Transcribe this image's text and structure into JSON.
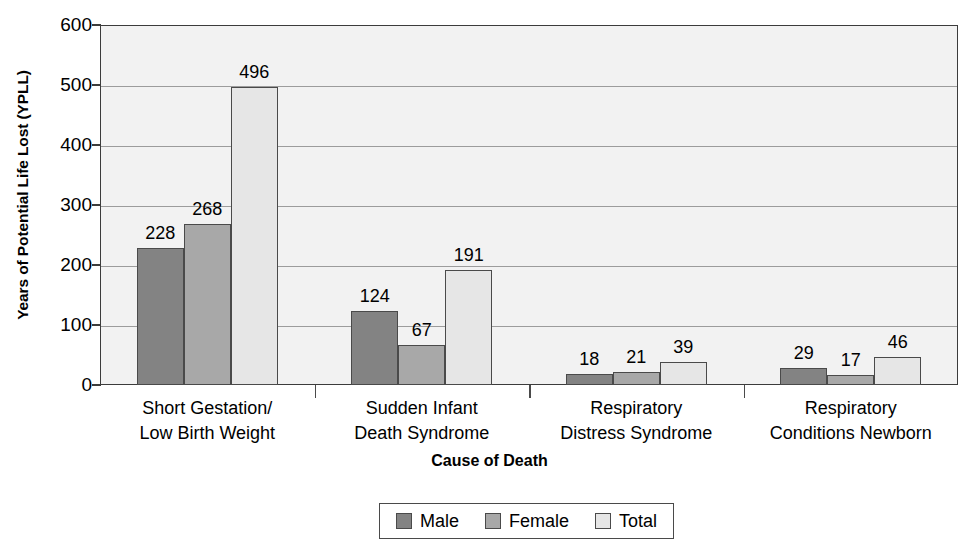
{
  "chart_data": {
    "type": "bar",
    "title": "",
    "xlabel": "Cause of Death",
    "ylabel": "Years of Potential Life Lost (YPLL)",
    "ylim": [
      0,
      600
    ],
    "yticks": [
      0,
      100,
      200,
      300,
      400,
      500,
      600
    ],
    "ytick_labels": [
      "0",
      "100",
      "200",
      "300",
      "400",
      "500",
      "600"
    ],
    "grid": true,
    "legend_position": "bottom-center",
    "categories": [
      "Short Gestation/\nLow Birth Weight",
      "Sudden Infant\nDeath Syndrome",
      "Respiratory\nDistress Syndrome",
      "Respiratory\nConditions Newborn"
    ],
    "category_lines": [
      [
        "Short Gestation/",
        "Low Birth Weight"
      ],
      [
        "Sudden Infant",
        "Death Syndrome"
      ],
      [
        "Respiratory",
        "Distress Syndrome"
      ],
      [
        "Respiratory",
        "Conditions Newborn"
      ]
    ],
    "series": [
      {
        "name": "Male",
        "color": "#838383",
        "values": [
          228,
          124,
          18,
          29
        ]
      },
      {
        "name": "Female",
        "color": "#a8a8a8",
        "values": [
          268,
          67,
          21,
          17
        ]
      },
      {
        "name": "Total",
        "color": "#e6e6e6",
        "values": [
          496,
          191,
          39,
          46
        ]
      }
    ],
    "data_labels": [
      [
        "228",
        "268",
        "496"
      ],
      [
        "124",
        "67",
        "191"
      ],
      [
        "18",
        "21",
        "39"
      ],
      [
        "29",
        "17",
        "46"
      ]
    ]
  },
  "legend": {
    "items": [
      {
        "label": "Male",
        "color": "#838383"
      },
      {
        "label": "Female",
        "color": "#a8a8a8"
      },
      {
        "label": "Total",
        "color": "#e6e6e6"
      }
    ]
  },
  "colors": {
    "plot_background": "#f2f2f2",
    "axis": "#3c3c3c",
    "gridline": "#9c9c9c",
    "bar_outline": "#4a4a4a",
    "text": "#000000"
  }
}
